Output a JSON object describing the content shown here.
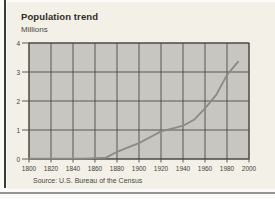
{
  "header": {
    "title": "Population trend",
    "subtitle": "Millions"
  },
  "footer": {
    "source": "Source: U.S. Bureau of the Census"
  },
  "colors": {
    "page_bg": "#fbfbf9",
    "card_bg": "#f3f0e7",
    "plot_bg": "#c7c6c1",
    "grid": "#4d4a44",
    "line": "#8c8a82",
    "tick_label": "#45423b",
    "bottom_rule": "#97948e",
    "left_border": "#3c3a36"
  },
  "chart_data": {
    "type": "line",
    "title": "Population trend",
    "ylabel": "Millions",
    "xlabel": "",
    "source": "Source: U.S. Bureau of the Census",
    "xlim": [
      1800,
      2000
    ],
    "ylim": [
      0,
      4
    ],
    "x_ticks": [
      1800,
      1820,
      1840,
      1860,
      1880,
      1900,
      1920,
      1940,
      1960,
      1980,
      2000
    ],
    "y_ticks": [
      0,
      1,
      2,
      3,
      4
    ],
    "grid": true,
    "legend": false,
    "series": [
      {
        "name": "Population (millions)",
        "x": [
          1800,
          1810,
          1820,
          1830,
          1840,
          1850,
          1860,
          1870,
          1880,
          1890,
          1900,
          1910,
          1920,
          1930,
          1940,
          1950,
          1960,
          1970,
          1980,
          1990
        ],
        "y": [
          0.01,
          0.01,
          0.01,
          0.01,
          0.01,
          0.01,
          0.03,
          0.05,
          0.25,
          0.4,
          0.55,
          0.75,
          0.95,
          1.05,
          1.15,
          1.35,
          1.75,
          2.2,
          2.9,
          3.35
        ]
      }
    ]
  }
}
